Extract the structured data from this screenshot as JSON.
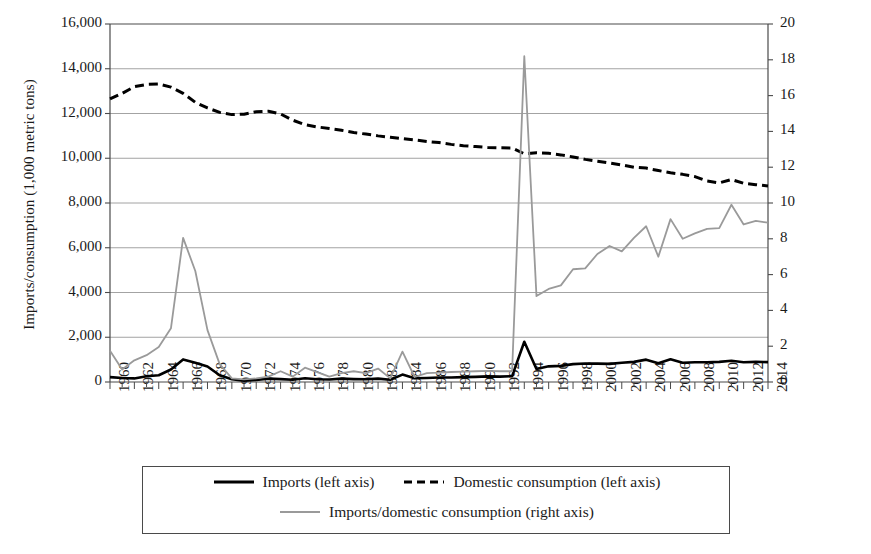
{
  "chart_data": {
    "type": "line",
    "title": "",
    "xlabel": "",
    "ylabel": "Imports/consumption (1,000 metric tons)",
    "ylabel_right": "Imports as percentage of domestic consumption",
    "xlim": [
      1960,
      2014
    ],
    "ylim": [
      0,
      16000
    ],
    "ylim_right": [
      0,
      20
    ],
    "ytick_step": 2000,
    "ytick_step_right": 2,
    "xtick_step": 2,
    "grid": "horizontal",
    "legend_position": "bottom",
    "x": [
      1960,
      1961,
      1962,
      1963,
      1964,
      1965,
      1966,
      1967,
      1968,
      1969,
      1970,
      1971,
      1972,
      1973,
      1974,
      1975,
      1976,
      1977,
      1978,
      1979,
      1980,
      1981,
      1982,
      1983,
      1984,
      1985,
      1986,
      1987,
      1988,
      1989,
      1990,
      1991,
      1992,
      1993,
      1994,
      1995,
      1996,
      1997,
      1998,
      1999,
      2000,
      2001,
      2002,
      2003,
      2004,
      2005,
      2006,
      2007,
      2008,
      2009,
      2010,
      2011,
      2012,
      2013,
      2014
    ],
    "xticks": [
      1960,
      1962,
      1964,
      1966,
      1968,
      1970,
      1972,
      1974,
      1976,
      1978,
      1980,
      1982,
      1984,
      1986,
      1988,
      1990,
      1992,
      1994,
      1996,
      1998,
      2000,
      2002,
      2004,
      2006,
      2008,
      2010,
      2012,
      2014
    ],
    "yticks_left": [
      "0",
      "2,000",
      "4,000",
      "6,000",
      "8,000",
      "10,000",
      "12,000",
      "14,000",
      "16,000"
    ],
    "yticks_right": [
      "0",
      "2",
      "4",
      "6",
      "8",
      "10",
      "12",
      "14",
      "16",
      "18",
      "20"
    ],
    "series": [
      {
        "name": "Imports (left axis)",
        "axis": "left",
        "style": "solid",
        "color": "#000000",
        "width": 2.6,
        "values": [
          220,
          180,
          160,
          260,
          300,
          560,
          1010,
          860,
          690,
          300,
          120,
          60,
          90,
          150,
          130,
          100,
          170,
          120,
          110,
          150,
          130,
          120,
          150,
          100,
          330,
          170,
          180,
          200,
          200,
          220,
          230,
          250,
          240,
          260,
          1800,
          580,
          700,
          720,
          800,
          830,
          820,
          810,
          860,
          900,
          1000,
          840,
          1020,
          860,
          880,
          880,
          900,
          950,
          880,
          900,
          890
        ]
      },
      {
        "name": "Domestic consumption (left axis)",
        "axis": "left",
        "style": "dashed",
        "color": "#000000",
        "width": 3.0,
        "values": [
          12650,
          12900,
          13200,
          13300,
          13320,
          13180,
          12900,
          12500,
          12250,
          12050,
          11950,
          11970,
          12080,
          12100,
          11980,
          11700,
          11500,
          11400,
          11330,
          11250,
          11150,
          11080,
          11000,
          10940,
          10880,
          10820,
          10750,
          10700,
          10620,
          10560,
          10520,
          10480,
          10470,
          10460,
          10200,
          10250,
          10220,
          10150,
          10060,
          9950,
          9870,
          9790,
          9700,
          9600,
          9560,
          9450,
          9350,
          9280,
          9180,
          8980,
          8900,
          9050,
          8880,
          8820,
          8760
        ]
      },
      {
        "name": "Imports/domestic consumption (right axis)",
        "axis": "right",
        "style": "solid",
        "color": "#9a9a9a",
        "width": 1.8,
        "values": [
          1.74,
          0.7,
          1.21,
          1.5,
          1.95,
          3.0,
          8.05,
          6.2,
          2.9,
          1.0,
          0.2,
          0.15,
          0.2,
          0.3,
          0.6,
          0.3,
          0.8,
          0.55,
          0.3,
          0.5,
          0.6,
          0.5,
          0.75,
          0.2,
          1.7,
          0.28,
          0.5,
          0.52,
          0.56,
          0.58,
          0.6,
          0.62,
          0.6,
          0.6,
          18.2,
          4.8,
          5.2,
          5.4,
          6.3,
          6.35,
          7.15,
          7.6,
          7.3,
          8.05,
          8.7,
          7.0,
          9.1,
          8.0,
          8.3,
          8.55,
          8.6,
          9.9,
          8.8,
          9.0,
          8.9
        ]
      }
    ]
  },
  "legend": {
    "entries": [
      {
        "label": "Imports (left axis)",
        "style": "solid",
        "color": "#000000"
      },
      {
        "label": "Domestic consumption (left axis)",
        "style": "dashed",
        "color": "#000000"
      },
      {
        "label": "Imports/domestic consumption (right axis)",
        "style": "solid",
        "color": "#9a9a9a"
      }
    ]
  },
  "axis_titles": {
    "left": "Imports/consumption (1,000 metric tons)",
    "right_line1": "Imports as percentage of domestic",
    "right_line2": "consumption"
  }
}
